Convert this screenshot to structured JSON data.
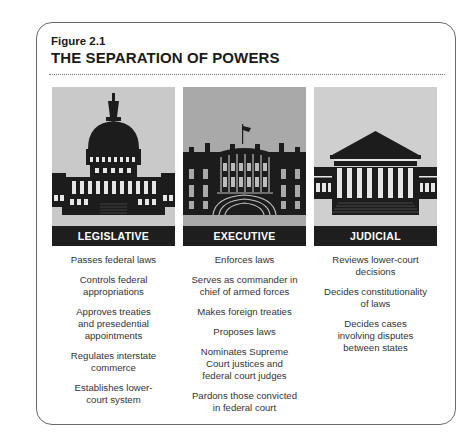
{
  "figure": {
    "number": "Figure 2.1",
    "title": "THE SEPARATION OF POWERS"
  },
  "colors": {
    "legislative_bg": "#c9c9c9",
    "executive_bg": "#a9a9a9",
    "judicial_bg": "#cfcfcf",
    "building": "#1c1c1c",
    "band": "#1e1e1e"
  },
  "branches": [
    {
      "label": "LEGISLATIVE",
      "icon": "capitol-building-icon",
      "powers": [
        "Passes federal laws",
        "Controls federal\nappropriations",
        "Approves treaties\nand presedential\nappointments",
        "Regulates interstate\ncommerce",
        "Establishes lower-\ncourt system"
      ]
    },
    {
      "label": "EXECUTIVE",
      "icon": "white-house-icon",
      "powers": [
        "Enforces laws",
        "Serves as commander in\nchief of armed forces",
        "Makes foreign treaties",
        "Proposes laws",
        "Nominates Supreme\nCourt justices and\nfederal court judges",
        "Pardons those convicted\nin federal court"
      ]
    },
    {
      "label": "JUDICIAL",
      "icon": "supreme-court-icon",
      "powers": [
        "Reviews lower-court\ndecisions",
        "Decides constitutionality\nof laws",
        "Decides cases\ninvolving disputes\nbetween states"
      ]
    }
  ]
}
